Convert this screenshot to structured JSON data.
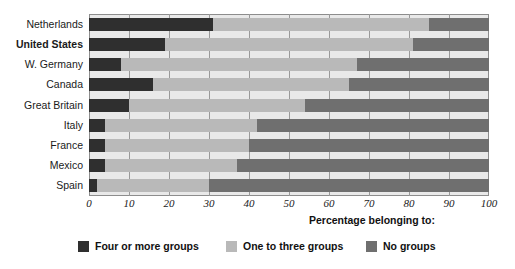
{
  "chart_data": {
    "type": "bar",
    "orientation": "horizontal",
    "stacked": true,
    "title": "",
    "xlabel": "Percentage belonging to:",
    "ylabel": "",
    "xlim": [
      0,
      100
    ],
    "grid": true,
    "legend_position": "bottom",
    "xticks": [
      0,
      10,
      20,
      30,
      40,
      50,
      60,
      70,
      80,
      90,
      100
    ],
    "categories": [
      "Netherlands",
      "United States",
      "W. Germany",
      "Canada",
      "Great Britain",
      "Italy",
      "France",
      "Mexico",
      "Spain"
    ],
    "emphasized_category": "United States",
    "series": [
      {
        "name": "Four or more groups",
        "color": "#2f2f2f",
        "values": [
          31,
          19,
          8,
          16,
          10,
          4,
          4,
          4,
          2
        ]
      },
      {
        "name": "One to three groups",
        "color": "#b9b9b9",
        "values": [
          54,
          62,
          59,
          49,
          44,
          38,
          36,
          33,
          28
        ]
      },
      {
        "name": "No groups",
        "color": "#6f6f6f",
        "values": [
          15,
          19,
          33,
          35,
          46,
          58,
          60,
          63,
          70
        ]
      }
    ]
  },
  "colors": {
    "four_or_more": "#2f2f2f",
    "one_to_three": "#b9b9b9",
    "no_groups": "#6f6f6f",
    "plot_background": "#e9e9e9",
    "gridline": "#9a9a9a",
    "border": "#8d8d8d"
  }
}
